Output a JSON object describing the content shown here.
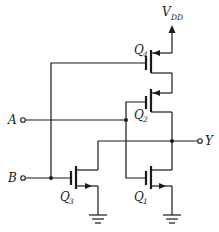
{
  "diagram": {
    "type": "CMOS NOR gate schematic",
    "supply": {
      "label": "V",
      "subscript": "DD"
    },
    "inputs": [
      {
        "label": "A"
      },
      {
        "label": "B"
      }
    ],
    "output": {
      "label": "Y"
    },
    "transistors": [
      {
        "name": "Q",
        "index": "4",
        "type": "PMOS",
        "gate": "B"
      },
      {
        "name": "Q",
        "index": "2",
        "type": "PMOS",
        "gate": "A"
      },
      {
        "name": "Q",
        "index": "3",
        "type": "NMOS",
        "gate": "B"
      },
      {
        "name": "Q",
        "index": "1",
        "type": "NMOS",
        "gate": "A"
      }
    ],
    "colors": {
      "ink": "#1a1a1a",
      "background": "#ffffff"
    }
  }
}
